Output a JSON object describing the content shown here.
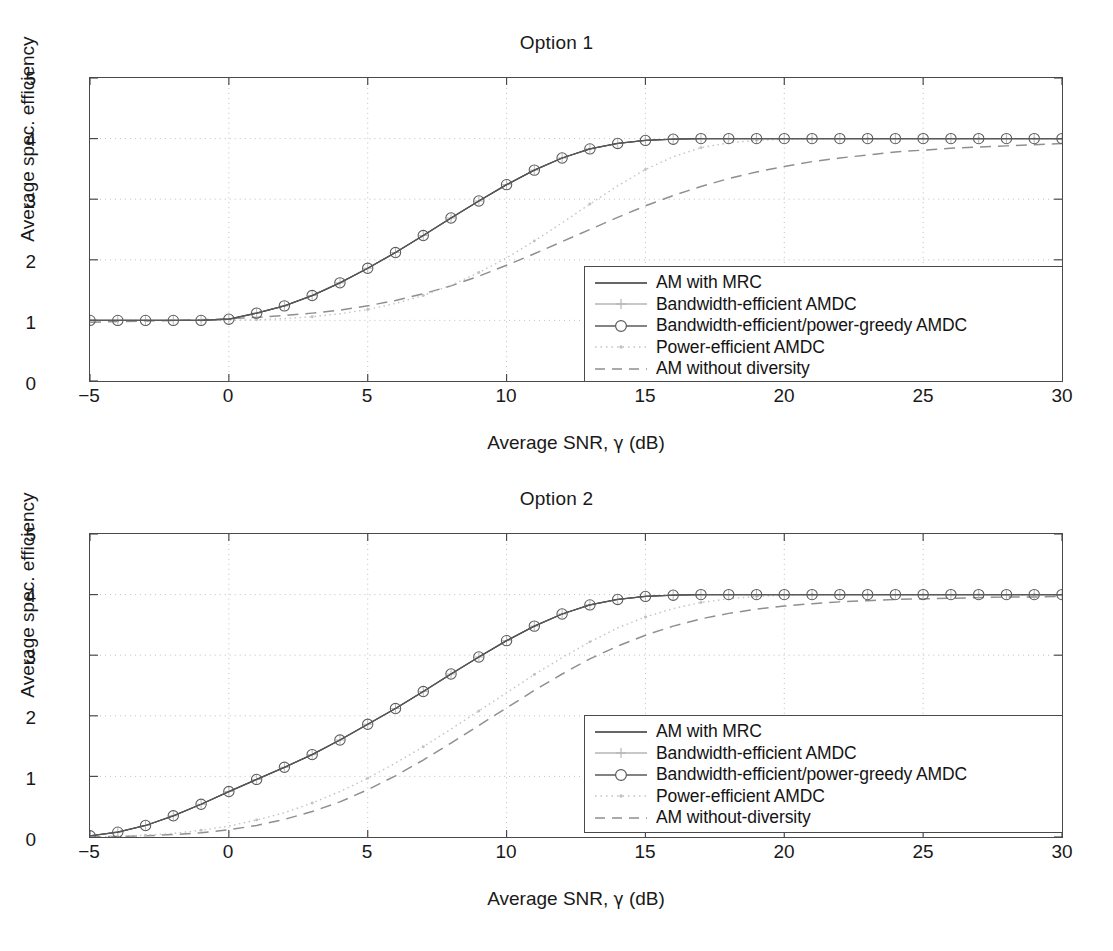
{
  "figure": {
    "background": "#ffffff",
    "axis_color": "#4a4a4a",
    "grid_color": "#bdbdbd"
  },
  "panels": [
    {
      "id": "option-1",
      "title": "Option 1",
      "xlabel_prefix": "Average SNR, ",
      "xlabel_symbol": "γ",
      "xlabel_suffix": " (dB)",
      "ylabel": "Average spec. efficiency",
      "xticks": [
        "−5",
        "0",
        "5",
        "10",
        "15",
        "20",
        "25",
        "30"
      ],
      "yticks": [
        "0",
        "1",
        "2",
        "3",
        "4",
        "5"
      ],
      "legend": [
        {
          "label": "AM with MRC",
          "style": "solid",
          "marker": "none",
          "color": "#333333"
        },
        {
          "label": "Bandwidth-efficient AMDC",
          "style": "solid",
          "marker": "plus",
          "color": "#b6b6b6"
        },
        {
          "label": "Bandwidth-efficient/power-greedy AMDC",
          "style": "solid",
          "marker": "circle",
          "color": "#5a5a5a"
        },
        {
          "label": "Power-efficient AMDC",
          "style": "dotted",
          "marker": "dot",
          "color": "#c2c2c2"
        },
        {
          "label": "AM without diversity",
          "style": "dashed",
          "marker": "none",
          "color": "#8f8f8f"
        }
      ]
    },
    {
      "id": "option-2",
      "title": "Option 2",
      "xlabel_prefix": "Average SNR, ",
      "xlabel_symbol": "γ",
      "xlabel_suffix": " (dB)",
      "ylabel": "Average spec. efficiency",
      "xticks": [
        "−5",
        "0",
        "5",
        "10",
        "15",
        "20",
        "25",
        "30"
      ],
      "yticks": [
        "0",
        "1",
        "2",
        "3",
        "4",
        "5"
      ],
      "legend": [
        {
          "label": "AM with MRC",
          "style": "solid",
          "marker": "none",
          "color": "#333333"
        },
        {
          "label": "Bandwidth-efficient AMDC",
          "style": "solid",
          "marker": "plus",
          "color": "#b6b6b6"
        },
        {
          "label": "Bandwidth-efficient/power-greedy AMDC",
          "style": "solid",
          "marker": "circle",
          "color": "#5a5a5a"
        },
        {
          "label": "Power-efficient AMDC",
          "style": "dotted",
          "marker": "dot",
          "color": "#c2c2c2"
        },
        {
          "label": "AM without-diversity",
          "style": "dashed",
          "marker": "none",
          "color": "#8f8f8f"
        }
      ]
    }
  ],
  "chart_data": [
    {
      "type": "line",
      "panel": "option-1",
      "title": "Option 1",
      "xlabel": "Average SNR, γ (dB)",
      "ylabel": "Average spec. efficiency",
      "xlim": [
        -5,
        30
      ],
      "ylim": [
        0,
        5
      ],
      "xticks": [
        -5,
        0,
        5,
        10,
        15,
        20,
        25,
        30
      ],
      "yticks": [
        0,
        1,
        2,
        3,
        4,
        5
      ],
      "grid": true,
      "legend_position": "lower right",
      "x": [
        -5,
        -4,
        -3,
        -2,
        -1,
        0,
        1,
        2,
        3,
        4,
        5,
        6,
        7,
        8,
        9,
        10,
        11,
        12,
        13,
        14,
        15,
        16,
        17,
        18,
        19,
        20,
        21,
        22,
        23,
        24,
        25,
        26,
        27,
        28,
        29,
        30
      ],
      "series": [
        {
          "name": "AM with MRC",
          "style": "solid",
          "marker": "none",
          "values": [
            1.0,
            1.0,
            1.0,
            1.0,
            1.0,
            1.02,
            1.12,
            1.24,
            1.41,
            1.62,
            1.86,
            2.12,
            2.4,
            2.69,
            2.97,
            3.24,
            3.48,
            3.68,
            3.83,
            3.92,
            3.97,
            3.99,
            4.0,
            4.0,
            4.0,
            4.0,
            4.0,
            4.0,
            4.0,
            4.0,
            4.0,
            4.0,
            4.0,
            4.0,
            4.0,
            4.0
          ]
        },
        {
          "name": "Bandwidth-efficient AMDC",
          "style": "solid",
          "marker": "plus",
          "values": [
            1.0,
            1.0,
            1.0,
            1.0,
            1.0,
            1.02,
            1.12,
            1.24,
            1.41,
            1.62,
            1.86,
            2.12,
            2.4,
            2.69,
            2.97,
            3.24,
            3.48,
            3.68,
            3.83,
            3.92,
            3.97,
            3.99,
            4.0,
            4.0,
            4.0,
            4.0,
            4.0,
            4.0,
            4.0,
            4.0,
            4.0,
            4.0,
            4.0,
            4.0,
            4.0,
            4.0
          ]
        },
        {
          "name": "Bandwidth-efficient/power-greedy AMDC",
          "style": "solid",
          "marker": "circle",
          "values": [
            1.0,
            1.0,
            1.0,
            1.0,
            1.0,
            1.02,
            1.12,
            1.24,
            1.41,
            1.62,
            1.86,
            2.12,
            2.4,
            2.69,
            2.97,
            3.24,
            3.48,
            3.68,
            3.83,
            3.92,
            3.97,
            3.99,
            4.0,
            4.0,
            4.0,
            4.0,
            4.0,
            4.0,
            4.0,
            4.0,
            4.0,
            4.0,
            4.0,
            4.0,
            4.0,
            4.0
          ]
        },
        {
          "name": "Power-efficient AMDC",
          "style": "dotted",
          "marker": "dot",
          "values": [
            1.0,
            1.0,
            1.0,
            1.0,
            1.0,
            1.0,
            1.01,
            1.03,
            1.06,
            1.11,
            1.18,
            1.28,
            1.41,
            1.58,
            1.79,
            2.03,
            2.31,
            2.61,
            2.92,
            3.22,
            3.49,
            3.7,
            3.85,
            3.93,
            3.97,
            3.99,
            4.0,
            4.0,
            4.0,
            4.0,
            4.0,
            4.0,
            4.0,
            4.0,
            4.0,
            4.0
          ]
        },
        {
          "name": "AM without diversity",
          "style": "dashed",
          "marker": "none",
          "values": [
            0.97,
            0.98,
            0.99,
            1.0,
            1.01,
            1.03,
            1.05,
            1.08,
            1.12,
            1.17,
            1.24,
            1.33,
            1.44,
            1.57,
            1.73,
            1.91,
            2.1,
            2.3,
            2.5,
            2.7,
            2.89,
            3.06,
            3.21,
            3.34,
            3.45,
            3.54,
            3.62,
            3.68,
            3.73,
            3.78,
            3.81,
            3.84,
            3.86,
            3.88,
            3.9,
            3.92
          ]
        }
      ]
    },
    {
      "type": "line",
      "panel": "option-2",
      "title": "Option 2",
      "xlabel": "Average SNR, γ (dB)",
      "ylabel": "Average spec. efficiency",
      "xlim": [
        -5,
        30
      ],
      "ylim": [
        0,
        5
      ],
      "xticks": [
        -5,
        0,
        5,
        10,
        15,
        20,
        25,
        30
      ],
      "yticks": [
        0,
        1,
        2,
        3,
        4,
        5
      ],
      "grid": true,
      "legend_position": "lower right",
      "x": [
        -5,
        -4,
        -3,
        -2,
        -1,
        0,
        1,
        2,
        3,
        4,
        5,
        6,
        7,
        8,
        9,
        10,
        11,
        12,
        13,
        14,
        15,
        16,
        17,
        18,
        19,
        20,
        21,
        22,
        23,
        24,
        25,
        26,
        27,
        28,
        29,
        30
      ],
      "series": [
        {
          "name": "AM with MRC",
          "style": "solid",
          "marker": "none",
          "values": [
            0.02,
            0.08,
            0.19,
            0.35,
            0.54,
            0.75,
            0.95,
            1.15,
            1.36,
            1.6,
            1.86,
            2.12,
            2.4,
            2.69,
            2.97,
            3.24,
            3.48,
            3.68,
            3.83,
            3.92,
            3.97,
            3.99,
            4.0,
            4.0,
            4.0,
            4.0,
            4.0,
            4.0,
            4.0,
            4.0,
            4.0,
            4.0,
            4.0,
            4.0,
            4.0,
            4.0
          ]
        },
        {
          "name": "Bandwidth-efficient AMDC",
          "style": "solid",
          "marker": "plus",
          "values": [
            0.02,
            0.08,
            0.19,
            0.35,
            0.54,
            0.75,
            0.95,
            1.15,
            1.36,
            1.6,
            1.86,
            2.12,
            2.4,
            2.69,
            2.97,
            3.24,
            3.48,
            3.68,
            3.83,
            3.92,
            3.97,
            3.99,
            4.0,
            4.0,
            4.0,
            4.0,
            4.0,
            4.0,
            4.0,
            4.0,
            4.0,
            4.0,
            4.0,
            4.0,
            4.0,
            4.0
          ]
        },
        {
          "name": "Bandwidth-efficient/power-greedy AMDC",
          "style": "solid",
          "marker": "circle",
          "values": [
            0.02,
            0.08,
            0.19,
            0.35,
            0.54,
            0.75,
            0.95,
            1.15,
            1.36,
            1.6,
            1.86,
            2.12,
            2.4,
            2.69,
            2.97,
            3.24,
            3.48,
            3.68,
            3.83,
            3.92,
            3.97,
            3.99,
            4.0,
            4.0,
            4.0,
            4.0,
            4.0,
            4.0,
            4.0,
            4.0,
            4.0,
            4.0,
            4.0,
            4.0,
            4.0,
            4.0
          ]
        },
        {
          "name": "Power-efficient AMDC",
          "style": "dotted",
          "marker": "dot",
          "values": [
            0.0,
            0.01,
            0.03,
            0.06,
            0.11,
            0.18,
            0.28,
            0.4,
            0.56,
            0.75,
            0.97,
            1.22,
            1.49,
            1.78,
            2.08,
            2.38,
            2.68,
            2.96,
            3.22,
            3.45,
            3.63,
            3.77,
            3.87,
            3.93,
            3.97,
            3.99,
            4.0,
            4.0,
            4.0,
            4.0,
            4.0,
            4.0,
            4.0,
            4.0,
            4.0,
            4.0
          ]
        },
        {
          "name": "AM without-diversity",
          "style": "dashed",
          "marker": "none",
          "values": [
            0.0,
            0.01,
            0.02,
            0.04,
            0.07,
            0.12,
            0.19,
            0.29,
            0.42,
            0.58,
            0.78,
            1.01,
            1.27,
            1.55,
            1.84,
            2.13,
            2.42,
            2.69,
            2.94,
            3.15,
            3.33,
            3.48,
            3.6,
            3.69,
            3.76,
            3.81,
            3.85,
            3.88,
            3.9,
            3.92,
            3.93,
            3.94,
            3.95,
            3.96,
            3.96,
            3.97
          ]
        }
      ]
    }
  ]
}
